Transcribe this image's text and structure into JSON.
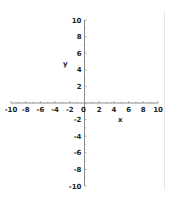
{
  "chart_data": {
    "type": "line",
    "title": "",
    "xlabel": "x",
    "ylabel": "y",
    "xlim": [
      -10,
      10
    ],
    "ylim": [
      -10,
      10
    ],
    "x_ticks": [
      -10,
      -8,
      -6,
      -4,
      -2,
      0,
      2,
      4,
      6,
      8,
      10
    ],
    "y_ticks": [
      10,
      8,
      6,
      4,
      2,
      -2,
      -4,
      -6,
      -8,
      -10
    ],
    "x_tick_labels": [
      "-10",
      "-8",
      "-6",
      "-4",
      "-2",
      "0",
      "2",
      "4",
      "6",
      "8",
      "10"
    ],
    "y_tick_labels": [
      "10",
      "8",
      "6",
      "4",
      "2",
      "-2",
      "-4",
      "-6",
      "-8",
      "-10"
    ],
    "minor_tick_step": 1,
    "grid": false,
    "legend": null,
    "series": []
  },
  "colors": {
    "axis": "#8c8c8c",
    "text": "#222222",
    "frame_line": "#e6e6e6",
    "background": "#ffffff"
  }
}
